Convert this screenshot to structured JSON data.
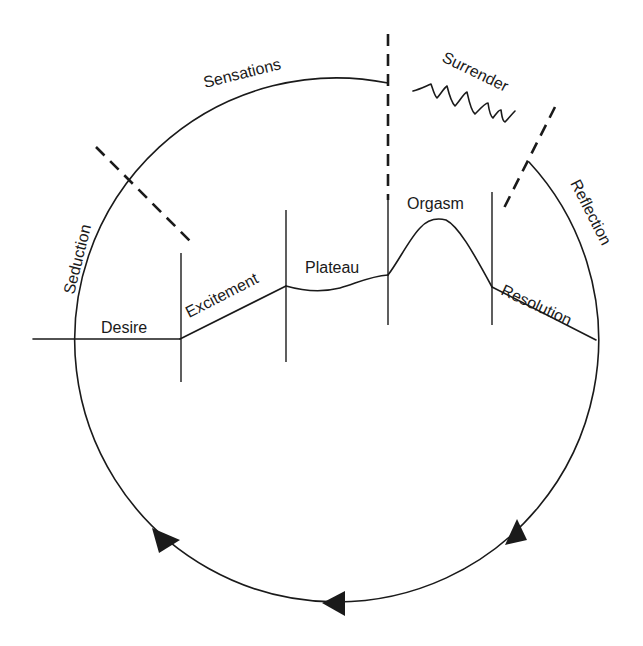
{
  "diagram": {
    "type": "sexual response cycle",
    "colors": {
      "line": "#1a1a1a",
      "background": "#ffffff"
    },
    "phases": {
      "desire": "Desire",
      "excitement": "Excitement",
      "plateau": "Plateau",
      "orgasm": "Orgasm",
      "resolution": "Resolution"
    },
    "cycle_labels": {
      "seduction": "Seduction",
      "sensations": "Sensations",
      "surrender": "Surrender",
      "reflection": "Reflection"
    },
    "arrows": [
      {
        "name": "arrow-lower-right",
        "direction": "counterclockwise"
      },
      {
        "name": "arrow-bottom",
        "direction": "left"
      },
      {
        "name": "arrow-lower-left",
        "direction": "up-left"
      }
    ]
  }
}
